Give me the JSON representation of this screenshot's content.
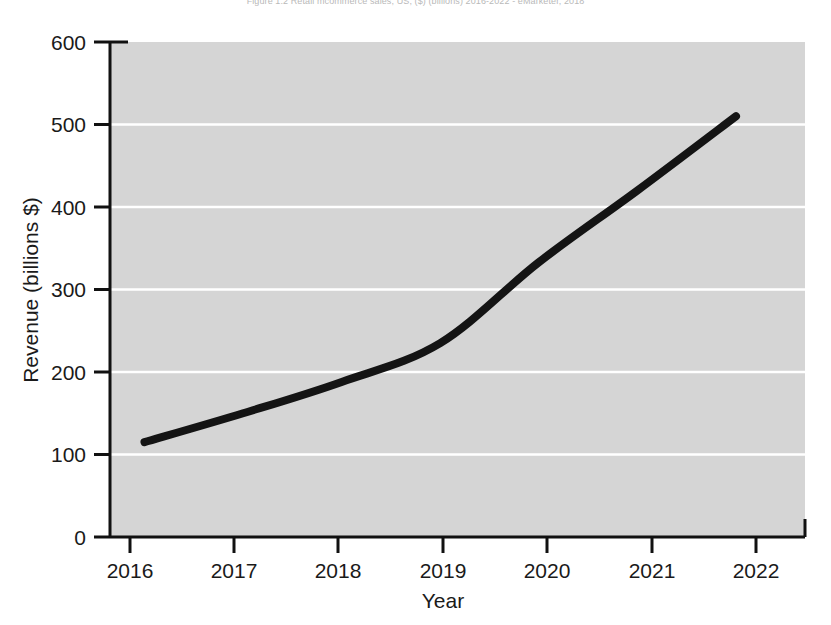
{
  "figure": {
    "title": "Figure 1.2  Retail mcommerce sales, US, ($) (billions) 2016-2022 - eMarketer, 2018"
  },
  "chart_data": {
    "type": "line",
    "title": "Figure 1.2  Retail mcommerce sales, US, ($) (billions) 2016-2022 - eMarketer, 2018",
    "xlabel": "Year",
    "ylabel": "Revenue (billions $)",
    "x": [
      2016,
      2017,
      2018,
      2019,
      2020,
      2021,
      2022
    ],
    "categories": [
      "2016",
      "2017",
      "2018",
      "2019",
      "2020",
      "2021",
      "2022"
    ],
    "values": [
      115,
      150,
      188,
      235,
      333,
      420,
      510
    ],
    "series": [
      {
        "name": "Retail mcommerce sales",
        "values": [
          115,
          150,
          188,
          235,
          333,
          420,
          510
        ]
      }
    ],
    "xlim": [
      2015.65,
      2022.7
    ],
    "ylim": [
      0,
      600
    ],
    "xticks": [
      "2016",
      "2017",
      "2018",
      "2019",
      "2020",
      "2021",
      "2022"
    ],
    "yticks": [
      "0",
      "100",
      "200",
      "300",
      "400",
      "500",
      "600"
    ],
    "grid": "horizontal",
    "grid_color": "#ffffff",
    "plot_background": "#d5d5d5",
    "line_color": "#141414",
    "line_width": 8,
    "legend": null,
    "legend_position": "none"
  }
}
